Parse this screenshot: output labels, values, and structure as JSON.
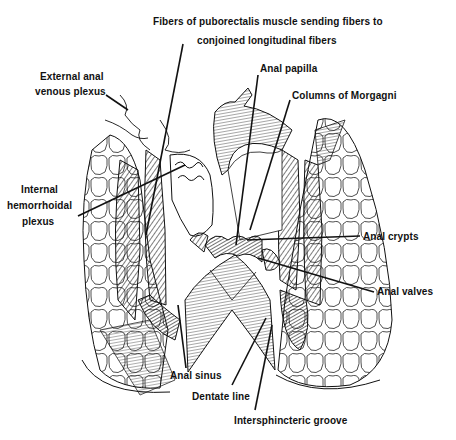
{
  "figure": {
    "labels": {
      "puborectalis_line1": "Fibers of puborectalis muscle sending fibers to",
      "puborectalis_line2": "conjoined longitudinal fibers",
      "external_plexus_line1": "External anal",
      "external_plexus_line2": "venous plexus",
      "internal_plexus_line1": "Internal",
      "internal_plexus_line2": "hemorrhoidal",
      "internal_plexus_line3": "plexus",
      "anal_papilla": "Anal papilla",
      "columns_of_morgagni": "Columns of Morgagni",
      "anal_crypts": "Anal crypts",
      "anal_valves": "Anal valves",
      "anal_sinus": "Anal sinus",
      "dentate_line": "Dentate line",
      "intersphincteric_groove": "Intersphincteric groove"
    },
    "colors": {
      "ink": "#111111",
      "background": "#ffffff"
    }
  }
}
